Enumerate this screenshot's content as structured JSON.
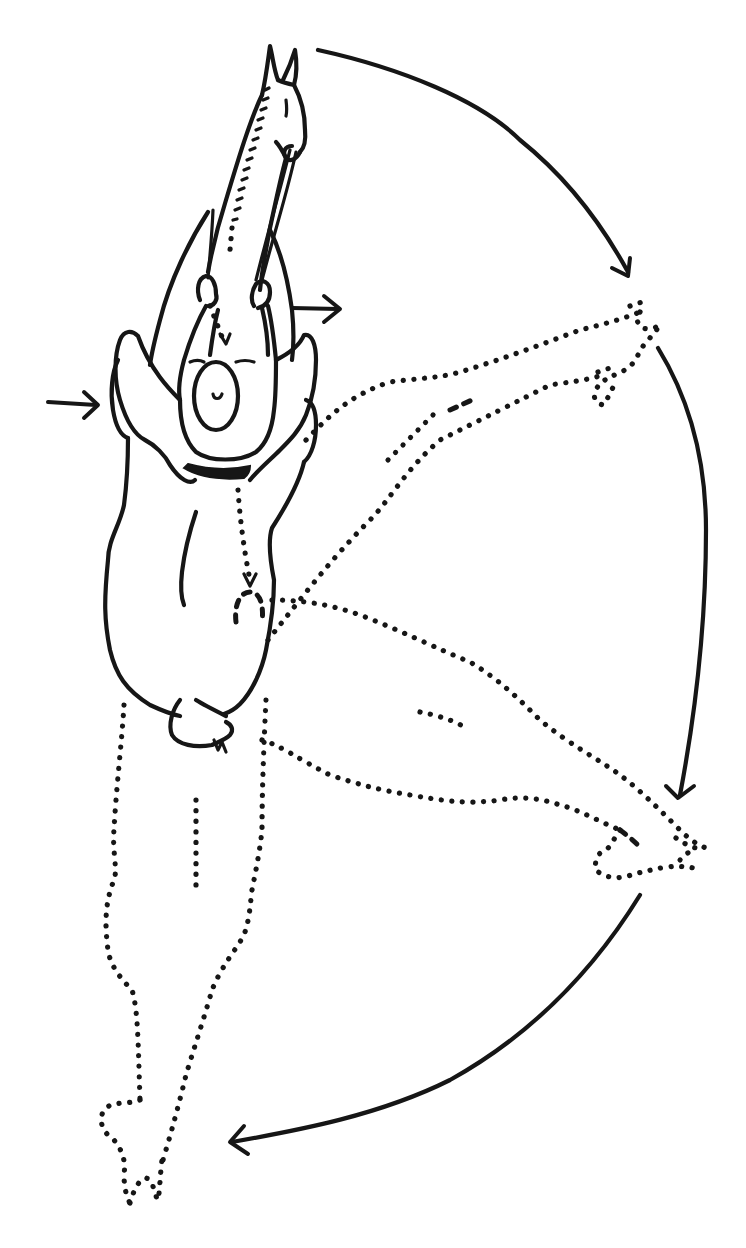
{
  "illustration": {
    "subject": "Horse and rider seen from above performing a turn on the forehand; hindquarters swing in an arc",
    "colors": {
      "ink": "#161616",
      "paper": "#ffffff"
    },
    "elements": [
      {
        "name": "horse-head-and-neck",
        "style": "solid",
        "position": "top-center"
      },
      {
        "name": "rider",
        "style": "solid",
        "position": "upper-center"
      },
      {
        "name": "horse-body",
        "style": "solid",
        "position": "center-left"
      },
      {
        "name": "hindquarters-start-position",
        "style": "dotted",
        "position": "bottom-left"
      },
      {
        "name": "hindquarters-intermediate-position-1",
        "style": "dotted",
        "position": "right-upper"
      },
      {
        "name": "hindquarters-intermediate-position-2",
        "style": "dotted",
        "position": "right-lower"
      },
      {
        "name": "rein-aid-indicator",
        "style": "dotted-arrow",
        "position": "from hands to rider"
      },
      {
        "name": "leg-aid-indicator",
        "style": "dotted-arrow",
        "position": "from rider to flank"
      }
    ],
    "arrows": [
      {
        "name": "left-leg-pressure-arrow",
        "direction": "right",
        "x": 48,
        "y": 403
      },
      {
        "name": "right-rein-direction-arrow",
        "direction": "right",
        "x": 296,
        "y": 308
      },
      {
        "name": "arc-arrow-1",
        "direction": "down-right",
        "from": [
          318,
          50
        ],
        "to": [
          628,
          275
        ]
      },
      {
        "name": "arc-arrow-2",
        "direction": "down",
        "from": [
          656,
          345
        ],
        "to": [
          678,
          800
        ]
      },
      {
        "name": "arc-arrow-3",
        "direction": "down-left",
        "from": [
          640,
          895
        ],
        "to": [
          232,
          1143
        ]
      }
    ]
  }
}
